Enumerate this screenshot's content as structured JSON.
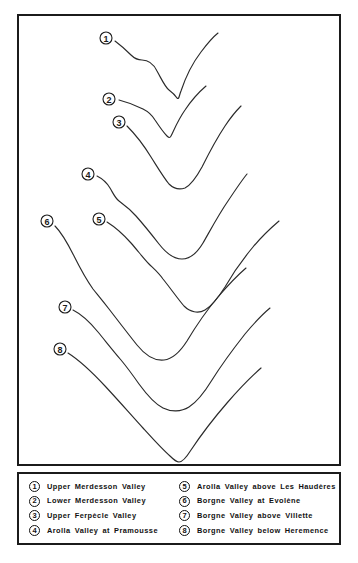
{
  "figure": {
    "panel_border_color": "#1b1b1b",
    "curve_color": "#2a2a2a",
    "background_color": "#ffffff"
  },
  "chart_data": {
    "type": "line",
    "xlabel": "",
    "ylabel": "",
    "grid": false,
    "legend_position": "bottom",
    "series": [
      {
        "name": "Upper Merdesson Valley",
        "marker": "1"
      },
      {
        "name": "Lower Merdesson Valley",
        "marker": "2"
      },
      {
        "name": "Upper Ferpècle Valley",
        "marker": "3"
      },
      {
        "name": "Arolla Valley at Pramousse",
        "marker": "4"
      },
      {
        "name": "Arolla Valley above Les Haudères",
        "marker": "5"
      },
      {
        "name": "Borgne Valley at Evolène",
        "marker": "6"
      },
      {
        "name": "Borgne Valley above Villette",
        "marker": "7"
      },
      {
        "name": "Borgne Valley below Heremence",
        "marker": "8"
      }
    ]
  },
  "profiles": [
    {
      "id": "profile-1",
      "marker": "1",
      "marker_x": 87,
      "marker_y": 22,
      "path": "M 96 25 C 104 31 108 35 112 39 C 116 43 119 44 123 44 C 129 44 134 47 138 55 C 143 64 146 71 150 74 C 154 77 156 79 158 82 C 160 84 160 80 162 75 C 166 63 172 49 182 36 C 188 28 194 21 199 17"
    },
    {
      "id": "profile-2",
      "marker": "2",
      "marker_x": 90,
      "marker_y": 83,
      "path": "M 100 84 C 108 86 116 89 124 93 C 130 96 133 99 136 104 C 140 110 144 116 148 120 C 150 122 151 122 152 120 C 155 114 159 104 166 94 C 172 85 180 76 187 70"
    },
    {
      "id": "profile-3",
      "marker": "3",
      "marker_x": 100,
      "marker_y": 106,
      "path": "M 108 110 C 116 118 124 128 132 141 C 139 152 145 162 150 168 C 154 172 160 174 166 172 C 172 169 177 162 183 151 C 190 137 198 122 206 110 C 212 101 218 94 222 90"
    },
    {
      "id": "profile-4",
      "marker": "4",
      "marker_x": 69,
      "marker_y": 158,
      "path": "M 78 160 C 84 163 88 167 91 172 C 94 177 96 182 100 185 C 104 188 110 192 117 200 C 125 209 133 219 140 228 C 147 237 155 243 163 243 C 171 243 178 237 184 227 C 192 213 200 198 209 185 C 217 173 223 164 228 158"
    },
    {
      "id": "profile-5",
      "marker": "5",
      "marker_x": 80,
      "marker_y": 203,
      "path": "M 88 206 C 96 211 104 218 112 227 C 119 235 125 243 130 248 C 134 252 139 256 144 263 C 152 273 159 283 165 290 C 171 296 179 298 186 294 C 193 290 199 282 206 271 C 214 257 224 243 234 231 C 244 219 253 211 260 205"
    },
    {
      "id": "profile-6",
      "marker": "6",
      "marker_x": 28,
      "marker_y": 205,
      "path": "M 36 210 C 42 216 48 226 55 240 C 62 254 69 266 74 273 C 78 278 83 284 90 293 C 100 306 110 319 118 329 C 126 339 136 345 145 344 C 154 343 161 336 168 325 C 177 310 188 294 199 281 C 210 268 220 258 227 252"
    },
    {
      "id": "profile-7",
      "marker": "7",
      "marker_x": 46,
      "marker_y": 291,
      "path": "M 54 294 C 62 298 70 305 79 316 C 88 327 96 337 102 344 C 107 350 113 358 120 368 C 128 379 136 388 144 392 C 152 396 162 396 170 391 C 178 386 185 377 193 364 C 203 348 215 332 226 318 C 236 306 245 297 251 292"
    },
    {
      "id": "profile-8",
      "marker": "8",
      "marker_x": 41,
      "marker_y": 333,
      "path": "M 49 337 C 60 344 72 355 86 370 C 100 385 113 400 124 412 C 134 423 143 433 151 440 C 155 444 158 446 160 446 C 163 446 167 442 172 434 C 182 419 195 402 208 387 C 221 372 233 360 242 352"
    }
  ],
  "legend": {
    "items": [
      {
        "marker": "1",
        "label": "Upper Merdesson Valley"
      },
      {
        "marker": "5",
        "label": "Arolla Valley above Les Haudères"
      },
      {
        "marker": "2",
        "label": "Lower Merdesson Valley"
      },
      {
        "marker": "6",
        "label": "Borgne Valley at Evolène"
      },
      {
        "marker": "3",
        "label": "Upper Ferpècle Valley"
      },
      {
        "marker": "7",
        "label": "Borgne Valley above Villette"
      },
      {
        "marker": "4",
        "label": "Arolla Valley at Pramousse"
      },
      {
        "marker": "8",
        "label": "Borgne Valley below Heremence"
      }
    ]
  }
}
